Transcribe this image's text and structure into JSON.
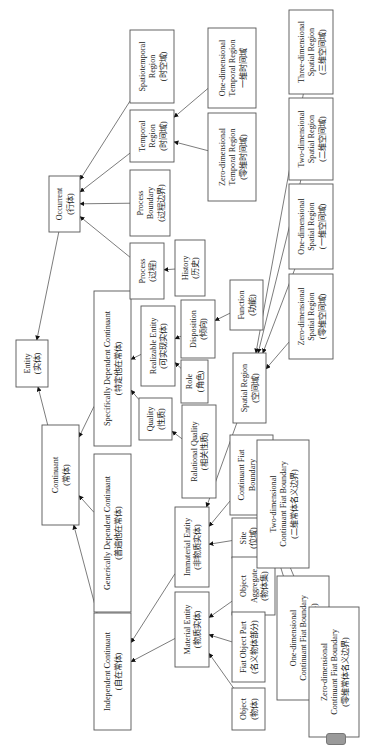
{
  "diagram": {
    "orientation": "rotated-90-ccw",
    "colors": {
      "box_border": "#555555",
      "text": "#222222",
      "arrow": "#111111",
      "background": "#ffffff"
    },
    "nodes": [
      {
        "id": "entity",
        "lines": [
          "Entity",
          "(实体)"
        ],
        "box": [
          16,
          340,
          32,
          47
        ]
      },
      {
        "id": "continuant",
        "lines": [
          "Continuant",
          "(常体)"
        ],
        "box": [
          42,
          425,
          37,
          100
        ]
      },
      {
        "id": "occurrent",
        "lines": [
          "Occurrent",
          "(行体)"
        ],
        "box": [
          49,
          176,
          31,
          56
        ]
      },
      {
        "id": "independent-continuant",
        "lines": [
          "Independent Continuant",
          "(自在常体)"
        ],
        "box": [
          94,
          613,
          37,
          117
        ]
      },
      {
        "id": "generically-dependent-continuant",
        "lines": [
          "Generically Dependent Continuant",
          "(普遍他在常体)"
        ],
        "box": [
          94,
          454,
          37,
          158
        ]
      },
      {
        "id": "specifically-dependent-continuant",
        "lines": [
          "Specifically Dependent Continuant",
          "(特定他在常体)"
        ],
        "box": [
          94,
          291,
          37,
          155
        ]
      },
      {
        "id": "process",
        "lines": [
          "Process",
          "(过程)"
        ],
        "box": [
          130,
          243,
          34,
          56
        ]
      },
      {
        "id": "process-boundary",
        "lines": [
          "Process",
          "Boundary",
          "(过程边界)"
        ],
        "box": [
          130,
          170,
          40,
          66
        ]
      },
      {
        "id": "temporal-region",
        "lines": [
          "Temporal",
          "Region",
          "(时间域)"
        ],
        "box": [
          130,
          110,
          44,
          52
        ]
      },
      {
        "id": "spatiotemporal-region",
        "lines": [
          "Spatiotemporal",
          "Region",
          "(时空域)"
        ],
        "box": [
          130,
          30,
          44,
          73
        ]
      },
      {
        "id": "history",
        "lines": [
          "History",
          "(历史)"
        ],
        "box": [
          175,
          240,
          30,
          56
        ]
      },
      {
        "id": "realizable-entity",
        "lines": [
          "Realizable Entity",
          "(可实现实体)"
        ],
        "box": [
          141,
          306,
          34,
          80
        ]
      },
      {
        "id": "quality",
        "lines": [
          "Quality",
          "(性质)"
        ],
        "box": [
          139,
          398,
          33,
          42
        ]
      },
      {
        "id": "relational-quality",
        "lines": [
          "Ralational Quality",
          "(相关性质)"
        ],
        "box": [
          182,
          405,
          34,
          93
        ]
      },
      {
        "id": "role",
        "lines": [
          "Role",
          "(角色)"
        ],
        "box": [
          181,
          360,
          27,
          43
        ]
      },
      {
        "id": "disposition",
        "lines": [
          "Disposition",
          "(倾向)"
        ],
        "box": [
          181,
          300,
          34,
          58
        ]
      },
      {
        "id": "function",
        "lines": [
          "Function",
          "(功能)"
        ],
        "box": [
          230,
          280,
          33,
          50
        ]
      },
      {
        "id": "spatial-region",
        "lines": [
          "Spatial Region",
          "(空间域)"
        ],
        "box": [
          233,
          353,
          33,
          70
        ]
      },
      {
        "id": "continuant-fiat-boundary",
        "lines": [
          "Continuant Fiat",
          "Boundary",
          "(常体名义边界)"
        ],
        "box": [
          230,
          435,
          43,
          80
        ]
      },
      {
        "id": "immaterial-entity",
        "lines": [
          "Immaterial Entity",
          "(非物质实体)"
        ],
        "box": [
          175,
          507,
          34,
          80
        ]
      },
      {
        "id": "material-entity",
        "lines": [
          "Material Entity",
          "(物质实体)"
        ],
        "box": [
          175,
          592,
          34,
          75
        ]
      },
      {
        "id": "site",
        "lines": [
          "Site",
          "(位域)"
        ],
        "box": [
          232,
          518,
          32,
          40
        ]
      },
      {
        "id": "object-aggregate",
        "lines": [
          "Object",
          "Aggregate",
          "(物体集)"
        ],
        "box": [
          232,
          557,
          43,
          58
        ]
      },
      {
        "id": "fiat-object-part",
        "lines": [
          "Fiat Object Part",
          "(名义物体部分)"
        ],
        "box": [
          232,
          612,
          33,
          70
        ]
      },
      {
        "id": "object",
        "lines": [
          "Object",
          "(物体)"
        ],
        "box": [
          232,
          688,
          33,
          42
        ]
      },
      {
        "id": "zero-dimensional-temporal-region",
        "lines": [
          "Zero-dimensional",
          "Temporal Region",
          "(零维时间域)"
        ],
        "box": [
          208,
          113,
          48,
          88
        ]
      },
      {
        "id": "one-dimensional-temporal-region",
        "lines": [
          "One-dimensional",
          "Temporal Region",
          "一维时间域"
        ],
        "box": [
          208,
          28,
          48,
          80
        ]
      },
      {
        "id": "zero-dimensional-spatial-region",
        "lines": [
          "Zero-dimensional",
          "Spatial Region",
          "(零维空间域)"
        ],
        "box": [
          289,
          274,
          44,
          85
        ]
      },
      {
        "id": "one-dimensional-spatial-region",
        "lines": [
          "One-dimensional",
          "Spatial Region",
          "(一维空间域)"
        ],
        "box": [
          289,
          184,
          44,
          85
        ]
      },
      {
        "id": "two-dimensional-spatial-region",
        "lines": [
          "Two-dimensional",
          "Spatial Region",
          "(二维空间域)"
        ],
        "box": [
          289,
          98,
          44,
          82
        ]
      },
      {
        "id": "three-dimensional-spatial-region",
        "lines": [
          "Three-dimensional",
          "Spatial Region",
          "(三维空间域)"
        ],
        "box": [
          289,
          10,
          44,
          84
        ]
      },
      {
        "id": "two-dimensional-continuant-fiat-boundary",
        "lines": [
          "Two-dimensional",
          "Continuant Fiat Boundary",
          "(二维常体名义边界)"
        ],
        "box": [
          257,
          440,
          52,
          128
        ]
      },
      {
        "id": "one-dimensional-continuant-fiat-boundary",
        "lines": [
          "One-dimensional",
          "Continuant Fiat Boundary",
          "(一维常体名义边界)"
        ],
        "box": [
          277,
          576,
          52,
          124
        ]
      },
      {
        "id": "zero-dimensional-continuant-fiat-boundary",
        "lines": [
          "Zero-dimensional",
          "Continuant Fiat Boundary",
          "(零维常体名义边界)"
        ],
        "box": [
          309,
          607,
          50,
          130
        ]
      }
    ],
    "edges": [
      [
        "continuant",
        "entity"
      ],
      [
        "occurrent",
        "entity"
      ],
      [
        "independent-continuant",
        "continuant"
      ],
      [
        "generically-dependent-continuant",
        "continuant"
      ],
      [
        "specifically-dependent-continuant",
        "continuant"
      ],
      [
        "process",
        "occurrent"
      ],
      [
        "process-boundary",
        "occurrent"
      ],
      [
        "temporal-region",
        "occurrent"
      ],
      [
        "spatiotemporal-region",
        "occurrent"
      ],
      [
        "history",
        "process"
      ],
      [
        "realizable-entity",
        "specifically-dependent-continuant"
      ],
      [
        "quality",
        "specifically-dependent-continuant"
      ],
      [
        "relational-quality",
        "quality"
      ],
      [
        "role",
        "realizable-entity"
      ],
      [
        "disposition",
        "realizable-entity"
      ],
      [
        "function",
        "disposition"
      ],
      [
        "zero-dimensional-temporal-region",
        "temporal-region"
      ],
      [
        "one-dimensional-temporal-region",
        "temporal-region"
      ],
      [
        "material-entity",
        "independent-continuant"
      ],
      [
        "immaterial-entity",
        "independent-continuant"
      ],
      [
        "spatial-region",
        "immaterial-entity"
      ],
      [
        "continuant-fiat-boundary",
        "immaterial-entity"
      ],
      [
        "site",
        "immaterial-entity"
      ],
      [
        "object-aggregate",
        "material-entity"
      ],
      [
        "fiat-object-part",
        "material-entity"
      ],
      [
        "object",
        "material-entity"
      ],
      [
        "zero-dimensional-spatial-region",
        "spatial-region"
      ],
      [
        "one-dimensional-spatial-region",
        "spatial-region"
      ],
      [
        "two-dimensional-spatial-region",
        "spatial-region"
      ],
      [
        "three-dimensional-spatial-region",
        "spatial-region"
      ],
      [
        "two-dimensional-continuant-fiat-boundary",
        "continuant-fiat-boundary"
      ],
      [
        "one-dimensional-continuant-fiat-boundary",
        "continuant-fiat-boundary"
      ],
      [
        "zero-dimensional-continuant-fiat-boundary",
        "continuant-fiat-boundary"
      ]
    ]
  }
}
